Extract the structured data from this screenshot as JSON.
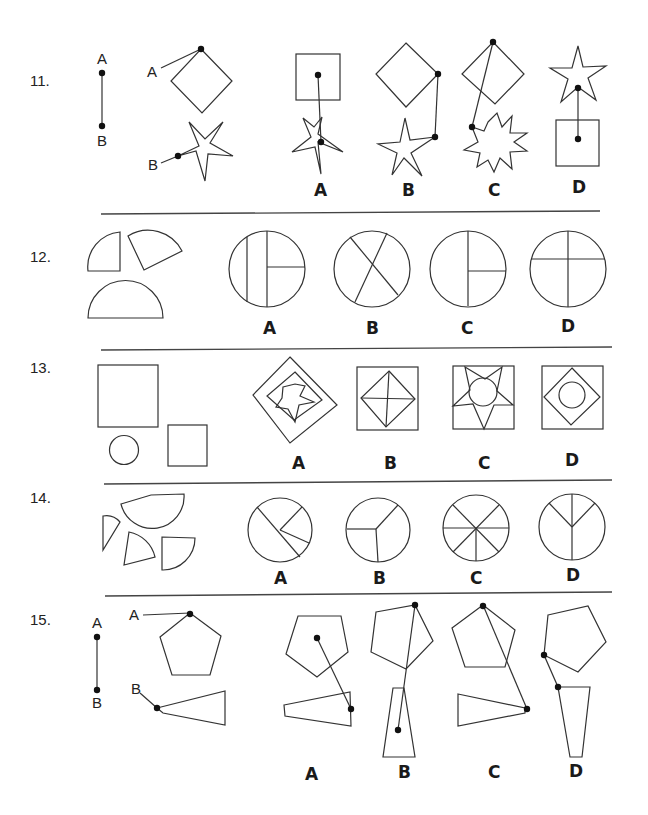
{
  "document": {
    "type": "spatial reasoning worksheet",
    "questions": [
      {
        "number": "11.",
        "prompt_labels": {
          "line_top": "A",
          "line_bottom": "B",
          "shape_a": "A",
          "shape_b": "B"
        },
        "prompt_shapes": [
          "line segment A-B",
          "diamond with point A at top vertex",
          "5-point star with point B at left point"
        ],
        "options": [
          {
            "label": "A",
            "description": "square above star, line from square center to star center"
          },
          {
            "label": "B",
            "description": "diamond above star, line from diamond right vertex to star right point"
          },
          {
            "label": "C",
            "description": "diamond above 9-point star, line from diamond top vertex to star left point"
          },
          {
            "label": "D",
            "description": "star above square, line from star center to square center"
          }
        ]
      },
      {
        "number": "12.",
        "prompt_shapes": [
          "quarter circle",
          "quarter circle (rotated)",
          "half circle"
        ],
        "options": [
          {
            "label": "A",
            "description": "circle with two vertical chords and one horizontal radius"
          },
          {
            "label": "B",
            "description": "circle divided by two crossing diagonal chords"
          },
          {
            "label": "C",
            "description": "circle with vertical diameter and horizontal radius to right"
          },
          {
            "label": "D",
            "description": "circle with vertical diameter and horizontal chord above center"
          }
        ]
      },
      {
        "number": "13.",
        "prompt_shapes": [
          "large square",
          "small circle",
          "medium square"
        ],
        "options": [
          {
            "label": "A",
            "description": "nested rotated squares with star inside"
          },
          {
            "label": "B",
            "description": "square containing diamond with cross"
          },
          {
            "label": "C",
            "description": "square containing star with circle"
          },
          {
            "label": "D",
            "description": "square containing diamond containing circle"
          }
        ]
      },
      {
        "number": "14.",
        "prompt_shapes": [
          "half circle",
          "thin sector",
          "sector",
          "quarter circle"
        ],
        "options": [
          {
            "label": "A",
            "description": "circle divided into 4 unequal sectors"
          },
          {
            "label": "B",
            "description": "circle divided into 3 sectors"
          },
          {
            "label": "C",
            "description": "circle divided into 8 equal sectors"
          },
          {
            "label": "D",
            "description": "circle divided into 3 sectors (Y shape)"
          }
        ]
      },
      {
        "number": "15.",
        "prompt_labels": {
          "line_top": "A",
          "line_bottom": "B",
          "shape_a": "A",
          "shape_b": "B"
        },
        "prompt_shapes": [
          "line segment A-B",
          "pentagon with point A at top vertex",
          "trapezoid with point B at narrow left end"
        ],
        "options": [
          {
            "label": "A",
            "description": "pentagon above trapezoid, line from pentagon center to trapezoid right edge"
          },
          {
            "label": "B",
            "description": "pentagon above vertical trapezoid, line from pentagon top-right vertex to trapezoid center"
          },
          {
            "label": "C",
            "description": "pentagon above trapezoid, line from pentagon top vertex to trapezoid right point"
          },
          {
            "label": "D",
            "description": "pentagon above vertical trapezoid, line from pentagon left vertex to trapezoid top-left corner"
          }
        ]
      }
    ]
  },
  "colors": {
    "ink": "#333333",
    "background": "#ffffff"
  }
}
